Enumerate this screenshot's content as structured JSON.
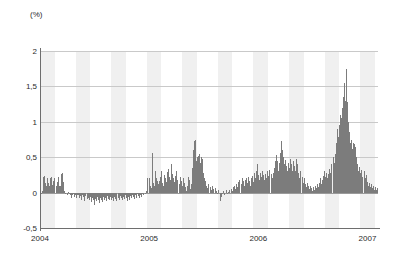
{
  "chart_data": {
    "type": "bar",
    "title": "",
    "subtitle": "",
    "xlabel": "",
    "ylabel": "(%)",
    "unit_label": "(%)",
    "grid": true,
    "legend": null,
    "ylim": [
      -0.5,
      2.0
    ],
    "ytick_values": [
      2,
      1.5,
      1,
      0.5,
      0,
      -0.5
    ],
    "ytick_labels": [
      "2",
      "1,5",
      "1",
      "0,5",
      "0",
      "-0,5"
    ],
    "xtick_labels": [
      "2004",
      "2005",
      "2006",
      "2007"
    ],
    "xtick_positions": [
      0.0,
      0.323,
      0.646,
      0.969
    ],
    "xlim_years": [
      2004.0,
      2007.1
    ],
    "bar_color": "#7c7c7c",
    "band_color": "#f0f0f0",
    "gridline_color": "#c9c9c9",
    "zeroline_color": "#9a9a9a",
    "axis_color": "#6e6e6e",
    "series": [
      {
        "name": "value",
        "values": [
          -0.04,
          -0.02,
          0.02,
          0.22,
          0.24,
          0.14,
          0.1,
          0.2,
          0.13,
          0.09,
          0.2,
          0.22,
          0.11,
          0.17,
          0.2,
          0.1,
          0.15,
          0.22,
          0.1,
          0.1,
          0.26,
          0.27,
          0.15,
          0.02,
          -0.02,
          0.0,
          -0.03,
          0.01,
          -0.02,
          -0.04,
          -0.07,
          -0.03,
          -0.02,
          -0.06,
          -0.03,
          -0.08,
          -0.04,
          -0.03,
          -0.07,
          -0.05,
          -0.1,
          -0.04,
          -0.06,
          -0.12,
          -0.05,
          -0.09,
          -0.07,
          -0.11,
          -0.06,
          -0.13,
          -0.07,
          -0.1,
          -0.18,
          -0.09,
          -0.12,
          -0.06,
          -0.11,
          -0.14,
          -0.07,
          -0.1,
          -0.13,
          -0.06,
          -0.1,
          -0.08,
          -0.12,
          -0.05,
          -0.09,
          -0.11,
          -0.06,
          -0.1,
          -0.08,
          -0.12,
          -0.06,
          -0.09,
          -0.12,
          -0.07,
          -0.1,
          -0.05,
          -0.08,
          -0.11,
          -0.06,
          -0.09,
          -0.04,
          -0.07,
          -0.12,
          -0.06,
          -0.1,
          -0.05,
          -0.08,
          -0.03,
          -0.06,
          -0.09,
          -0.04,
          -0.07,
          -0.02,
          -0.05,
          -0.08,
          -0.03,
          -0.06,
          -0.01,
          -0.04,
          0.0,
          -0.02,
          0.02,
          0.2,
          0.21,
          0.1,
          0.06,
          0.56,
          0.14,
          0.1,
          0.31,
          0.2,
          0.17,
          0.12,
          0.16,
          0.22,
          0.3,
          0.13,
          0.09,
          0.25,
          0.2,
          0.15,
          0.29,
          0.34,
          0.22,
          0.18,
          0.4,
          0.26,
          0.2,
          0.15,
          0.24,
          0.3,
          0.18,
          0.12,
          0.22,
          0.16,
          0.1,
          0.2,
          0.14,
          0.08,
          0.02,
          0.1,
          0.22,
          0.18,
          0.05,
          0.12,
          0.35,
          0.6,
          0.73,
          0.75,
          0.45,
          0.5,
          0.52,
          0.54,
          0.42,
          0.5,
          0.48,
          0.28,
          0.2,
          0.16,
          0.1,
          0.06,
          0.12,
          0.08,
          0.03,
          0.1,
          0.05,
          0.0,
          0.06,
          0.02,
          -0.02,
          0.04,
          0.0,
          -0.12,
          -0.06,
          -0.02,
          0.02,
          -0.04,
          0.0,
          0.03,
          -0.02,
          0.01,
          0.04,
          0.0,
          0.05,
          0.02,
          0.08,
          0.1,
          0.05,
          0.12,
          0.08,
          0.15,
          0.18,
          0.12,
          0.2,
          0.16,
          0.1,
          0.18,
          0.2,
          0.14,
          0.22,
          0.17,
          0.1,
          0.2,
          0.24,
          0.15,
          0.28,
          0.2,
          0.3,
          0.4,
          0.25,
          0.18,
          0.28,
          0.22,
          0.3,
          0.25,
          0.18,
          0.26,
          0.2,
          0.3,
          0.24,
          0.32,
          0.26,
          0.2,
          0.28,
          0.35,
          0.44,
          0.53,
          0.45,
          0.3,
          0.42,
          0.56,
          0.73,
          0.6,
          0.5,
          0.4,
          0.46,
          0.38,
          0.3,
          0.42,
          0.35,
          0.47,
          0.4,
          0.3,
          0.44,
          0.38,
          0.3,
          0.47,
          0.4,
          0.28,
          0.2,
          0.3,
          0.22,
          0.14,
          0.2,
          0.12,
          0.08,
          0.14,
          0.1,
          0.05,
          0.1,
          0.06,
          0.02,
          0.08,
          0.04,
          0.1,
          0.06,
          0.12,
          0.08,
          0.14,
          0.2,
          0.12,
          0.18,
          0.24,
          0.3,
          0.22,
          0.28,
          0.2,
          0.26,
          0.34,
          0.28,
          0.4,
          0.5,
          0.42,
          0.55,
          0.7,
          0.9,
          0.78,
          0.95,
          1.1,
          1.05,
          1.2,
          1.35,
          1.55,
          1.3,
          1.75,
          1.28,
          1.0,
          0.85,
          0.7,
          0.75,
          0.62,
          0.7,
          0.68,
          0.65,
          0.5,
          0.4,
          0.3,
          0.36,
          0.28,
          0.32,
          0.22,
          0.3,
          0.2,
          0.25,
          0.15,
          0.1,
          0.14,
          0.08,
          0.12,
          0.06,
          0.1,
          0.04,
          0.08,
          0.03,
          0.06
        ]
      }
    ]
  }
}
